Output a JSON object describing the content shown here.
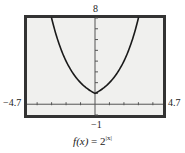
{
  "chart_data": {
    "type": "line",
    "title": "",
    "function": "f(x) = 2^|x|",
    "xlim": [
      -4.7,
      4.7
    ],
    "ylim": [
      -1,
      8
    ],
    "xtick_step": 1,
    "ytick_step": 1,
    "grid": false,
    "xlabel": "",
    "ylabel": "",
    "series": [
      {
        "name": "f(x) = 2^|x|",
        "x": [
          -3,
          -2.5,
          -2,
          -1.5,
          -1,
          -0.5,
          0,
          0.5,
          1,
          1.5,
          2,
          2.5,
          3
        ],
        "y": [
          8,
          5.66,
          4,
          2.83,
          2,
          1.41,
          1,
          1.41,
          2,
          2.83,
          4,
          5.66,
          8
        ]
      }
    ],
    "window_labels": {
      "ymax": "8",
      "ymin": "-1",
      "xmin": "-4.7",
      "xmax": "4.7"
    }
  },
  "labels": {
    "ymax": "8",
    "ymin": "−1",
    "xmin": "−4.7",
    "xmax": "4.7"
  },
  "caption": {
    "func": "f(x)",
    "equals": " = 2",
    "exponent": "|x|"
  },
  "colors": {
    "frame": "#333333",
    "plot_bg": "#f0f0ee",
    "curve": "#1a1a1a",
    "axis": "#555555"
  }
}
